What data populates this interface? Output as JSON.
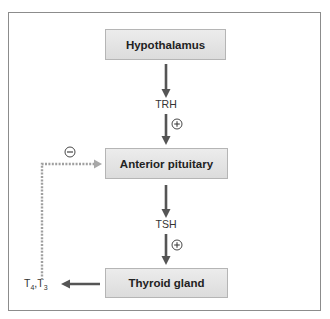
{
  "diagram": {
    "nodes": [
      {
        "id": "hypothalamus",
        "label": "Hypothalamus"
      },
      {
        "id": "anterior_pituitary",
        "label": "Anterior pituitary"
      },
      {
        "id": "thyroid_gland",
        "label": "Thyroid gland"
      }
    ],
    "hormones": {
      "trh": "TRH",
      "tsh": "TSH",
      "t4": "T",
      "t4_sub": "4",
      "separator": ",",
      "t3": "T",
      "t3_sub": "3"
    },
    "signs": {
      "stimulatory": "+",
      "inhibitory": "−"
    },
    "edges": [
      {
        "from": "hypothalamus",
        "to": "anterior_pituitary",
        "via": "TRH",
        "effect": "+",
        "style": "solid"
      },
      {
        "from": "anterior_pituitary",
        "to": "thyroid_gland",
        "via": "TSH",
        "effect": "+",
        "style": "solid"
      },
      {
        "from": "thyroid_gland",
        "to": "T4,T3",
        "style": "solid"
      },
      {
        "from": "T4,T3",
        "to": "anterior_pituitary",
        "effect": "−",
        "style": "dotted"
      }
    ],
    "colors": {
      "arrow": "#555555",
      "feedback": "#a0a0a0",
      "box_fill": "#e4e4e4",
      "box_border": "#b5b5b5",
      "frame_border": "#8c8c8c"
    }
  }
}
